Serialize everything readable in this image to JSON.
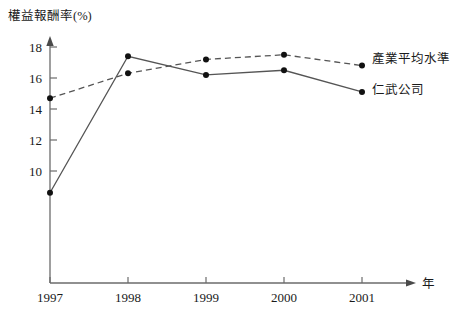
{
  "chart_data": {
    "type": "line",
    "title": "",
    "xlabel": "年",
    "ylabel": "權益報酬率(%)",
    "categories": [
      "1997",
      "1998",
      "1999",
      "2000",
      "2001"
    ],
    "xlim": [
      1997,
      2001
    ],
    "ylim": [
      8,
      18.8
    ],
    "yticks": [
      10,
      12,
      14,
      16,
      18
    ],
    "ytick_labels": [
      "10",
      "12",
      "14",
      "16",
      "18"
    ],
    "grid": false,
    "legend_position": "right-inline-end-of-line",
    "series": [
      {
        "name": "產業平均水準",
        "style": "dashed",
        "marker": "filled-circle",
        "color": "#555555",
        "values": [
          14.7,
          16.3,
          17.2,
          17.5,
          16.8
        ]
      },
      {
        "name": "仁武公司",
        "style": "solid",
        "marker": "filled-circle",
        "color": "#555555",
        "values": [
          8.6,
          17.4,
          16.2,
          16.5,
          15.1
        ]
      }
    ]
  },
  "axes": {
    "y_axis_title": "權益報酬率(%)",
    "x_axis_title": "年",
    "y_tick_labels": [
      "18",
      "16",
      "14",
      "12",
      "10"
    ],
    "x_tick_labels": [
      "1997",
      "1998",
      "1999",
      "2000",
      "2001"
    ]
  },
  "legend": {
    "industry_average_label": "產業平均水準",
    "company_label": "仁武公司"
  },
  "colors": {
    "axis": "#6b6b6b",
    "line": "#555555",
    "marker": "#111111",
    "text": "#1a1a1a",
    "background": "#ffffff"
  }
}
